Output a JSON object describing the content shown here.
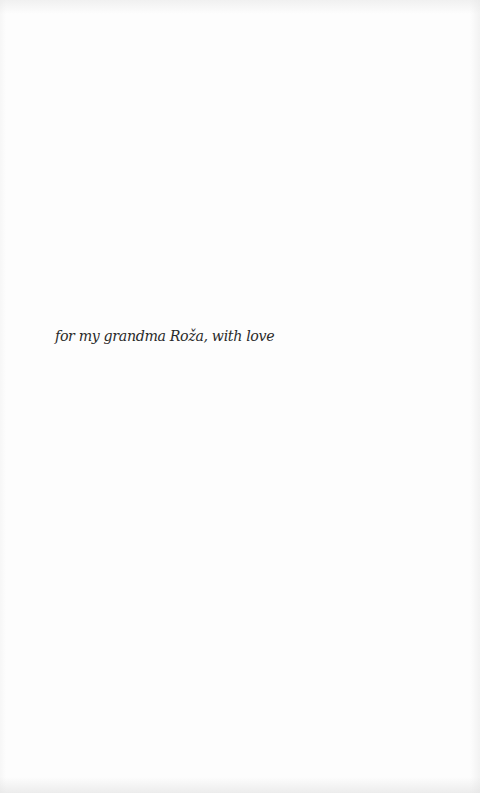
{
  "page": {
    "dedication": "for my grandma Roža, with love"
  },
  "colors": {
    "background": "#fdfdfd",
    "text": "#2a2a2a"
  }
}
